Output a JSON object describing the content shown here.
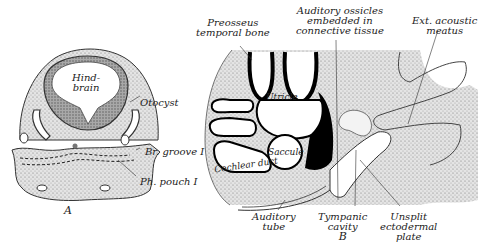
{
  "figure": {
    "panel_a": {
      "letter": "A",
      "labels": {
        "hindbrain_line1": "Hind-",
        "hindbrain_line2": "brain",
        "otocyst": "Otocyst",
        "br_groove": "Br. groove I",
        "ph_pouch": "Ph. pouch I"
      }
    },
    "panel_b": {
      "letter": "B",
      "labels": {
        "preosseus_line1": "Preosseus",
        "preosseus_line2": "temporal bone",
        "ossicles_line1": "Auditory ossicles",
        "ossicles_line2": "embedded in",
        "ossicles_line3": "connective tissue",
        "meatus_line1": "Ext. acoustic",
        "meatus_line2": "meatus",
        "utricle": "Utricle",
        "saccule": "Saccule",
        "cochlear_duct": "Cochlear duct",
        "aud_tube_line1": "Auditory",
        "aud_tube_line2": "tube",
        "tympanic_line1": "Tympanic",
        "tympanic_line2": "cavity",
        "plate_line1": "Unsplit",
        "plate_line2": "ectodermal",
        "plate_line3": "plate"
      }
    },
    "colors": {
      "ink": "#111111",
      "tissue": "#d9d9d9",
      "brain": "#9a9a9a",
      "paper": "#ffffff"
    }
  }
}
